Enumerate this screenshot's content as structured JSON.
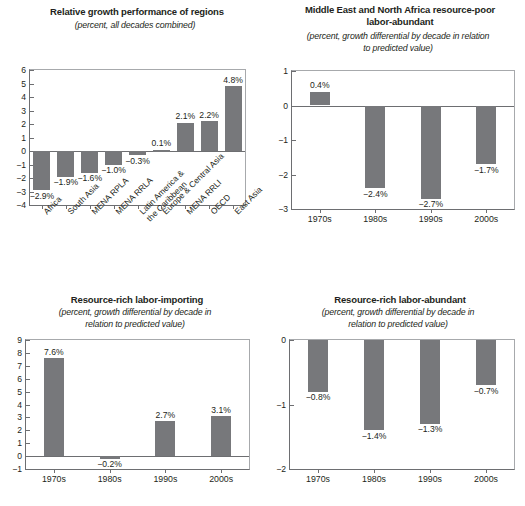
{
  "figure": {
    "background": "#ffffff",
    "bar_color": "#77787b",
    "axis_color": "#6d6e71",
    "text_color": "#231f20"
  },
  "panels": [
    {
      "id": "relative-growth-performance-of-regions",
      "title": "Relative growth performance of regions",
      "subtitle": "(percent, all decades combined)"
    },
    {
      "id": "mena-resource-poor-labor-abundant",
      "title_line1": "Middle East and North Africa resource-poor",
      "title_line2": "labor-abundant",
      "subtitle_line1": "(percent, growth differential by decade in relation",
      "subtitle_line2": "to predicted value)"
    },
    {
      "id": "resource-rich-labor-importing",
      "title": "Resource-rich labor-importing",
      "subtitle_line1": "(percent, growth differential by decade in",
      "subtitle_line2": "relation to predicted value)"
    },
    {
      "id": "resource-rich-labor-abundant",
      "title": "Resource-rich labor-abundant",
      "subtitle_line1": "(percent, growth differential by decade in",
      "subtitle_line2": "relation to predicted value)"
    }
  ],
  "chart_data": [
    {
      "type": "bar",
      "id": "relative-growth-performance-of-regions",
      "title": "Relative growth performance of regions",
      "subtitle": "(percent, all decades combined)",
      "xlabel": "",
      "ylabel": "",
      "ylim": [
        -4,
        6
      ],
      "yticks": [
        -4,
        -3,
        -2,
        -1,
        0,
        1,
        2,
        3,
        4,
        5,
        6
      ],
      "ytick_labels": [
        "−4",
        "−3",
        "−2",
        "−1",
        "0",
        "1",
        "2",
        "3",
        "4",
        "5",
        "6"
      ],
      "grid": false,
      "legend": "none",
      "categories": [
        "Africa",
        "South Asia",
        "MENA RPLA",
        "MENA RRLA",
        "Latin America & the Caribbean",
        "Europe & Central Asia",
        "MENA RRLI",
        "OECD",
        "East Asia"
      ],
      "category_lines": [
        [
          "Africa"
        ],
        [
          "South Asia"
        ],
        [
          "MENA RPLA"
        ],
        [
          "MENA RRLA"
        ],
        [
          "Latin America &",
          "the Caribbean"
        ],
        [
          "Europe & Central Asia"
        ],
        [
          "MENA RRLI"
        ],
        [
          "OECD"
        ],
        [
          "East Asia"
        ]
      ],
      "values": [
        -2.9,
        -1.9,
        -1.6,
        -1.0,
        -0.3,
        0.1,
        2.1,
        2.2,
        4.8
      ],
      "data_labels": [
        "−2.9%",
        "−1.9%",
        "−1.6%",
        "−1.0%",
        "−0.3%",
        "0.1%",
        "2.1%",
        "2.2%",
        "4.8%"
      ]
    },
    {
      "type": "bar",
      "id": "mena-resource-poor-labor-abundant",
      "title": "Middle East and North Africa resource-poor labor-abundant",
      "subtitle": "(percent, growth differential by decade in relation to predicted value)",
      "xlabel": "",
      "ylabel": "",
      "ylim": [
        -3,
        1
      ],
      "yticks": [
        -3,
        -2,
        -1,
        0,
        1
      ],
      "ytick_labels": [
        "−3",
        "−2",
        "−1",
        "0",
        "1"
      ],
      "grid": false,
      "legend": "none",
      "categories": [
        "1970s",
        "1980s",
        "1990s",
        "2000s"
      ],
      "values": [
        0.4,
        -2.4,
        -2.7,
        -1.7
      ],
      "data_labels": [
        "0.4%",
        "−2.4%",
        "−2.7%",
        "−1.7%"
      ]
    },
    {
      "type": "bar",
      "id": "resource-rich-labor-importing",
      "title": "Resource-rich labor-importing",
      "subtitle": "(percent, growth differential by decade in relation to predicted value)",
      "xlabel": "",
      "ylabel": "",
      "ylim": [
        -1,
        9
      ],
      "yticks": [
        -1,
        0,
        1,
        2,
        3,
        4,
        5,
        6,
        7,
        8,
        9
      ],
      "ytick_labels": [
        "−1",
        "0",
        "1",
        "2",
        "3",
        "4",
        "5",
        "6",
        "7",
        "8",
        "9"
      ],
      "grid": false,
      "legend": "none",
      "categories": [
        "1970s",
        "1980s",
        "1990s",
        "2000s"
      ],
      "values": [
        7.6,
        -0.2,
        2.7,
        3.1
      ],
      "data_labels": [
        "7.6%",
        "−0.2%",
        "2.7%",
        "3.1%"
      ]
    },
    {
      "type": "bar",
      "id": "resource-rich-labor-abundant",
      "title": "Resource-rich labor-abundant",
      "subtitle": "(percent, growth differential by decade in relation to predicted value)",
      "xlabel": "",
      "ylabel": "",
      "ylim": [
        -2,
        0
      ],
      "yticks": [
        -2,
        -1,
        0
      ],
      "ytick_labels": [
        "−2",
        "−1",
        "0"
      ],
      "grid": false,
      "legend": "none",
      "categories": [
        "1970s",
        "1980s",
        "1990s",
        "2000s"
      ],
      "values": [
        -0.8,
        -1.4,
        -1.3,
        -0.7
      ],
      "data_labels": [
        "−0.8%",
        "−1.4%",
        "−1.3%",
        "−0.7%"
      ]
    }
  ]
}
